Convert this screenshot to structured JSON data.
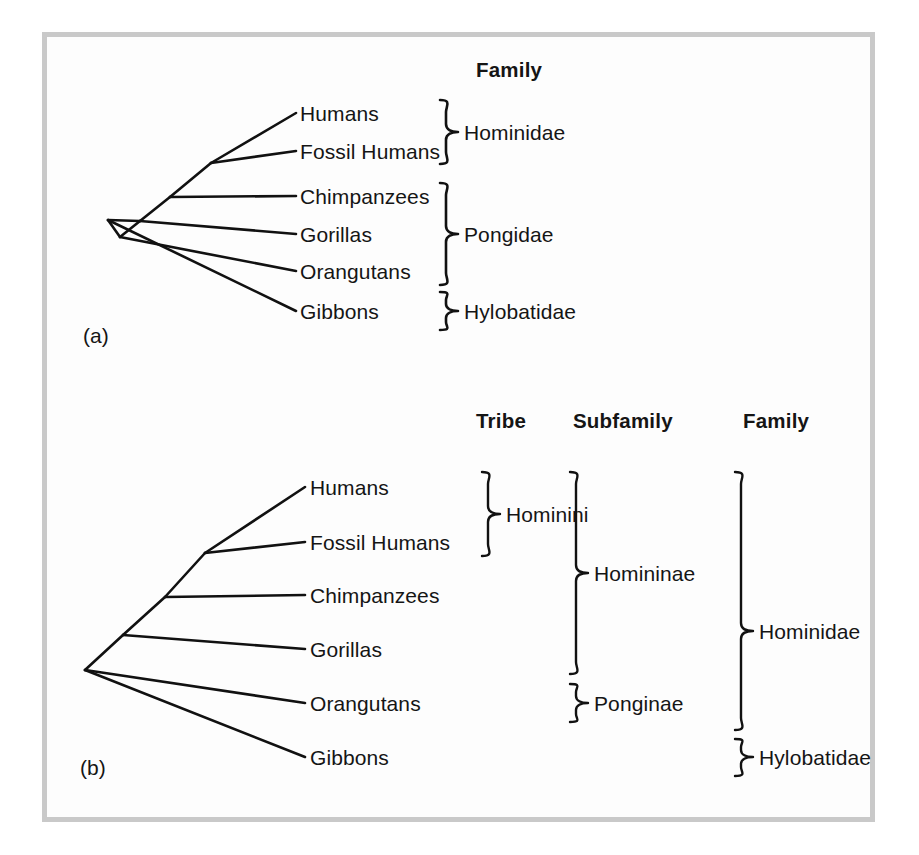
{
  "figure": {
    "background_color": "#fdfdfd",
    "frame_color": "#c9c9c9",
    "line_color": "#111111",
    "text_color": "#151515"
  },
  "panel_a": {
    "caption": "(a)",
    "headings": [
      {
        "label": "Family"
      }
    ],
    "taxa": [
      {
        "label": "Humans"
      },
      {
        "label": "Fossil Humans"
      },
      {
        "label": "Chimpanzees"
      },
      {
        "label": "Gorillas"
      },
      {
        "label": "Orangutans"
      },
      {
        "label": "Gibbons"
      }
    ],
    "groups": [
      {
        "label": "Hominidae",
        "rank": "Family",
        "members": [
          "Humans",
          "Fossil Humans"
        ]
      },
      {
        "label": "Pongidae",
        "rank": "Family",
        "members": [
          "Chimpanzees",
          "Gorillas",
          "Orangutans"
        ]
      },
      {
        "label": "Hylobatidae",
        "rank": "Family",
        "members": [
          "Gibbons"
        ]
      }
    ]
  },
  "panel_b": {
    "caption": "(b)",
    "headings": [
      {
        "label": "Tribe"
      },
      {
        "label": "Subfamily"
      },
      {
        "label": "Family"
      }
    ],
    "taxa": [
      {
        "label": "Humans"
      },
      {
        "label": "Fossil Humans"
      },
      {
        "label": "Chimpanzees"
      },
      {
        "label": "Gorillas"
      },
      {
        "label": "Orangutans"
      },
      {
        "label": "Gibbons"
      }
    ],
    "groups_tribe": [
      {
        "label": "Hominini",
        "members": [
          "Humans",
          "Fossil Humans"
        ]
      }
    ],
    "groups_subfamily": [
      {
        "label": "Homininae",
        "members": [
          "Humans",
          "Fossil Humans",
          "Chimpanzees",
          "Gorillas"
        ]
      },
      {
        "label": "Ponginae",
        "members": [
          "Orangutans"
        ]
      }
    ],
    "groups_family": [
      {
        "label": "Hominidae",
        "members": [
          "Humans",
          "Fossil Humans",
          "Chimpanzees",
          "Gorillas",
          "Orangutans"
        ]
      },
      {
        "label": "Hylobatidae",
        "members": [
          "Gibbons"
        ]
      }
    ]
  }
}
